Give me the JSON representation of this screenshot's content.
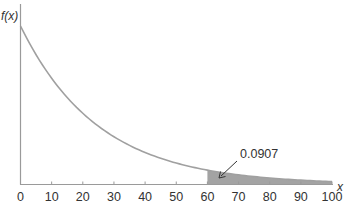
{
  "chart_data": {
    "type": "area",
    "title": "",
    "xlabel": "x",
    "ylabel": "f(x)",
    "distribution": "exponential",
    "mean": 25,
    "xlim": [
      0,
      100
    ],
    "x_ticks": [
      0,
      10,
      20,
      30,
      40,
      50,
      60,
      70,
      80,
      90,
      100
    ],
    "x_tick_labels": [
      "0",
      "10",
      "20",
      "30",
      "40",
      "50",
      "60",
      "70",
      "80",
      "90",
      "100"
    ],
    "y_ticks": [],
    "curve": {
      "x": [
        0,
        10,
        20,
        30,
        40,
        50,
        60,
        70,
        80,
        90,
        100
      ],
      "y": [
        0.04,
        0.0268,
        0.018,
        0.012,
        0.0081,
        0.0054,
        0.0036,
        0.0024,
        0.0016,
        0.0011,
        0.0007
      ]
    },
    "shaded_region": {
      "from": 60,
      "to": 100,
      "probability": 0.0907
    },
    "annotations": [
      {
        "text": "0.0907",
        "points_to": "shaded region x ≥ 60"
      }
    ],
    "grid": false,
    "legend": null
  },
  "colors": {
    "curve": "#a0a0a0",
    "shade": "#a3a3a3",
    "axis": "#9a9a9a",
    "text": "#333333",
    "arrow": "#333333"
  }
}
